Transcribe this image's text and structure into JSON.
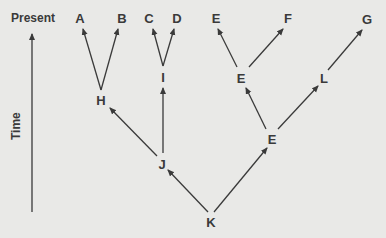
{
  "axis": {
    "top_label": "Present",
    "side_label": "Time"
  },
  "nodes": {
    "A": "A",
    "B": "B",
    "C": "C",
    "D": "D",
    "E_top": "E",
    "F": "F",
    "G": "G",
    "H": "H",
    "I": "I",
    "J": "J",
    "K": "K",
    "E_mid": "E",
    "E_low": "E",
    "L": "L"
  },
  "edges": [
    [
      "K",
      "J"
    ],
    [
      "K",
      "E_low"
    ],
    [
      "J",
      "H"
    ],
    [
      "J",
      "I"
    ],
    [
      "H",
      "A"
    ],
    [
      "H",
      "B"
    ],
    [
      "I",
      "C"
    ],
    [
      "I",
      "D"
    ],
    [
      "E_low",
      "E_mid"
    ],
    [
      "E_low",
      "L"
    ],
    [
      "E_mid",
      "E_top"
    ],
    [
      "E_mid",
      "F"
    ],
    [
      "L",
      "G"
    ]
  ],
  "colors": {
    "line": "#3a3a3a",
    "background": "#e9e9e7"
  }
}
